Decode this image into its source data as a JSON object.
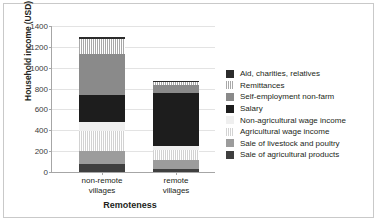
{
  "chart_data": {
    "type": "bar",
    "subtype": "stacked-column",
    "title": "",
    "xlabel": "Remoteness",
    "ylabel": "Household income (USD)",
    "categories": [
      "non-remote villages",
      "remote villages"
    ],
    "ylim": [
      0,
      1400
    ],
    "yticks": [
      0,
      200,
      400,
      600,
      800,
      1000,
      1200,
      1400
    ],
    "ytick_labels": [
      "0",
      "200",
      "400",
      "600",
      "800",
      "1000",
      "1200",
      "1400"
    ],
    "grid": true,
    "legend_position": "right",
    "series": [
      {
        "name": "Sale of agricultural products",
        "color": "#3f3f3f",
        "pattern": "solid",
        "values": [
          80,
          25
        ]
      },
      {
        "name": "Sale of livestock and poultry",
        "color": "#9c9c9c",
        "pattern": "solid",
        "values": [
          120,
          95
        ]
      },
      {
        "name": "Agricultural wage income",
        "color": "#d2d2d2",
        "pattern": "hatch",
        "values": [
          190,
          95
        ]
      },
      {
        "name": "Non-agricultural wage income",
        "color": "#efefef",
        "pattern": "solid",
        "values": [
          90,
          35
        ]
      },
      {
        "name": "Salary",
        "color": "#1d1d1d",
        "pattern": "solid",
        "values": [
          255,
          510
        ]
      },
      {
        "name": "Self-employment non-farm",
        "color": "#8a8a8a",
        "pattern": "solid",
        "values": [
          400,
          75
        ]
      },
      {
        "name": "Remittances",
        "color": "#a8a8a8",
        "pattern": "hatch",
        "values": [
          140,
          25
        ]
      },
      {
        "name": "Aid, charities, relatives",
        "color": "#2b2b2b",
        "pattern": "solid",
        "values": [
          15,
          10
        ]
      }
    ],
    "totals": [
      1290,
      870
    ]
  },
  "legend": {
    "items": [
      {
        "label": "Aid, charities, relatives"
      },
      {
        "label": "Remittances"
      },
      {
        "label": "Self-employment non-farm"
      },
      {
        "label": "Salary"
      },
      {
        "label": "Non-agricultural wage income"
      },
      {
        "label": "Agricultural wage income"
      },
      {
        "label": "Sale of livestock and poultry"
      },
      {
        "label": "Sale of agricultural products"
      }
    ]
  }
}
